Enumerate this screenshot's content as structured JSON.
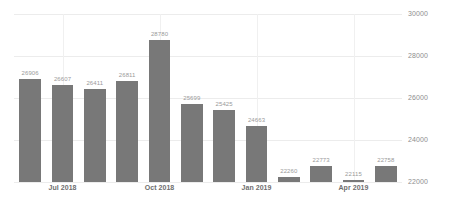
{
  "chart_data": {
    "type": "bar",
    "title": "",
    "subtitle": "",
    "xlabel": "",
    "ylabel": "",
    "ylim": [
      22000,
      30000
    ],
    "y_ticks": [
      22000,
      24000,
      26000,
      28000,
      30000
    ],
    "y_tick_labels": [
      "22000",
      "24000",
      "26000",
      "28000",
      "30000"
    ],
    "y_axis_position": "right",
    "grid": true,
    "legend": false,
    "categories": [
      "Jun 2018",
      "Jul 2018",
      "Aug 2018",
      "Sep 2018",
      "Oct 2018",
      "Nov 2018",
      "Dec 2018",
      "Jan 2019",
      "Feb 2019",
      "Mar 2019",
      "Apr 2019",
      "May 2019"
    ],
    "values": [
      26906,
      26607,
      26411,
      26811,
      28780,
      25699,
      25425,
      24663,
      22260,
      22773,
      22115,
      22758
    ],
    "value_labels": [
      "26906",
      "26607",
      "26411",
      "26811",
      "28780",
      "25699",
      "25425",
      "24663",
      "22260",
      "22773",
      "22115",
      "22758"
    ],
    "x_tick_labels": [
      "Jul 2018",
      "Oct 2018",
      "Jan 2019",
      "Apr 2019"
    ],
    "x_tick_indices": [
      1,
      4,
      7,
      10
    ],
    "bar_color": "#787878",
    "value_label_color": "#9a9a9a",
    "axis_label_color": "#8e8e8e",
    "grid_color": "#ececec",
    "background_color": "#ffffff"
  }
}
